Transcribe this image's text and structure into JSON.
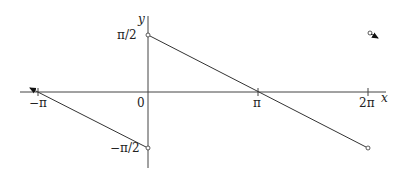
{
  "diagram": {
    "type": "function-graph",
    "axes": {
      "x_label": "x",
      "y_label": "y",
      "origin_label": "0",
      "x_ticks": [
        "−π",
        "π",
        "2π"
      ],
      "y_ticks": [
        "π/2",
        "−π/2"
      ]
    },
    "segments": [
      {
        "name": "main-segment",
        "from": [
          "0",
          "π/2"
        ],
        "to": [
          "2π",
          "−π/2"
        ],
        "endpoints": "open"
      },
      {
        "name": "left-segment",
        "from": [
          "0",
          "−π/2"
        ],
        "to": [
          "−π",
          "0"
        ],
        "continues": "arrow"
      }
    ],
    "colors": {
      "line": "#333333",
      "axis": "#444444",
      "background": "#ffffff"
    }
  }
}
